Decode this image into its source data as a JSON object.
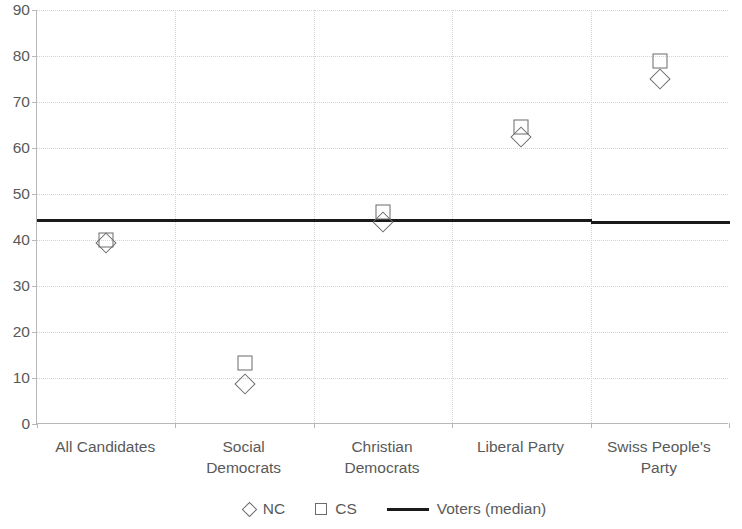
{
  "chart_data": {
    "type": "scatter",
    "title": "",
    "xlabel": "",
    "ylabel": "",
    "ylim": [
      0,
      90
    ],
    "ytick_step": 10,
    "yticks": [
      0,
      10,
      20,
      30,
      40,
      50,
      60,
      70,
      80,
      90
    ],
    "ytick_labels": [
      "0",
      "10",
      "20",
      "30",
      "40",
      "50",
      "60",
      "70",
      "80",
      "90"
    ],
    "grid": true,
    "legend_position": "bottom",
    "categories": [
      "All Candidates",
      "Social\nDemocrats",
      "Christian\nDemocrats",
      "Liberal Party",
      "Swiss People's\nParty"
    ],
    "series": [
      {
        "name": "NC",
        "marker": "diamond",
        "color": "#6b6b6b",
        "values": [
          39.3,
          8.7,
          44.0,
          62.5,
          75.0
        ]
      },
      {
        "name": "CS",
        "marker": "square",
        "color": "#6b6b6b",
        "values": [
          40.0,
          13.3,
          46.0,
          64.5,
          79.0
        ]
      },
      {
        "name": "Voters (median)",
        "marker": "line",
        "color": "#1a1a1a",
        "values": [
          44.5,
          44.5,
          44.5,
          44.5,
          44.2
        ]
      }
    ]
  },
  "legend": {
    "items": [
      {
        "label": "NC",
        "glyph": "diamond-marker-icon"
      },
      {
        "label": "CS",
        "glyph": "square-marker-icon"
      },
      {
        "label": "Voters (median)",
        "glyph": "line-marker-icon"
      }
    ]
  },
  "axes": {
    "y_axis_name": "value-axis",
    "x_axis_name": "category-axis"
  }
}
